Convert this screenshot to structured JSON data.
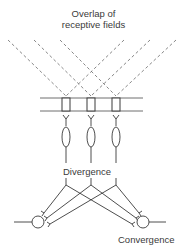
{
  "diagram": {
    "title_line1": "Overlap of",
    "title_line2": "receptive fields",
    "divergence_label": "Divergence",
    "convergence_label": "Convergence",
    "colors": {
      "stroke": "#3a3a3a",
      "dashed": "#6a6a6a",
      "background": "#ffffff"
    },
    "components": {
      "receptive_field_lines": 6,
      "receptor_boxes": 3,
      "synapses": 3,
      "neuron_bodies_elongated": 3,
      "convergence_neurons": 2
    }
  }
}
